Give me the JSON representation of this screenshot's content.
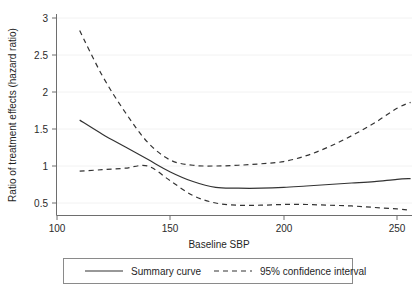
{
  "chart_data": {
    "type": "line",
    "title": "",
    "xlabel": "Baseline SBP",
    "ylabel": "Ratio of treatment effects (hazard ratio)",
    "xlim": [
      100,
      258
    ],
    "ylim": [
      0.35,
      3.05
    ],
    "xticks": [
      100,
      150,
      200,
      250
    ],
    "xtick_labels": [
      "100",
      "150",
      "200",
      "250"
    ],
    "yticks": [
      0.5,
      1,
      1.5,
      2,
      2.5,
      3
    ],
    "ytick_labels": [
      "0.5",
      "1",
      "1.5",
      "2",
      "2.5",
      "3"
    ],
    "grid": "horizontal-faint",
    "legend_position": "below-plot",
    "series": [
      {
        "name": "Summary curve",
        "style": "solid",
        "color": "#333333",
        "x": [
          110,
          120,
          130,
          140,
          150,
          160,
          170,
          180,
          190,
          200,
          210,
          220,
          230,
          240,
          250,
          256
        ],
        "values": [
          1.62,
          1.43,
          1.26,
          1.09,
          0.92,
          0.79,
          0.71,
          0.7,
          0.7,
          0.71,
          0.73,
          0.75,
          0.77,
          0.79,
          0.82,
          0.83
        ]
      },
      {
        "name": "95% confidence interval (upper)",
        "style": "dashed",
        "color": "#333333",
        "x": [
          110,
          120,
          130,
          140,
          150,
          160,
          170,
          180,
          190,
          200,
          210,
          220,
          230,
          240,
          250,
          256
        ],
        "values": [
          2.83,
          2.22,
          1.73,
          1.32,
          1.08,
          1.01,
          1.0,
          1.01,
          1.03,
          1.06,
          1.14,
          1.26,
          1.41,
          1.58,
          1.78,
          1.86
        ]
      },
      {
        "name": "95% confidence interval (lower)",
        "style": "dashed",
        "color": "#333333",
        "x": [
          110,
          120,
          130,
          140,
          150,
          160,
          170,
          180,
          190,
          200,
          210,
          220,
          230,
          240,
          250,
          256
        ],
        "values": [
          0.93,
          0.95,
          0.97,
          1.0,
          0.8,
          0.6,
          0.5,
          0.47,
          0.47,
          0.48,
          0.48,
          0.47,
          0.46,
          0.44,
          0.42,
          0.4
        ]
      }
    ],
    "annotations": {
      "crossing_point": {
        "x": 140,
        "y": 1.0,
        "note": "All three curves converge near HR = 1"
      }
    }
  },
  "legend": {
    "entries": [
      {
        "label": "Summary curve",
        "style": "solid"
      },
      {
        "label": "95% confidence interval",
        "style": "dashed"
      }
    ]
  },
  "colors": {
    "line": "#333333",
    "axis": "#6e6e6e",
    "grid": "#f2f2f2",
    "background": "#ffffff",
    "text": "#1f1f1f"
  }
}
